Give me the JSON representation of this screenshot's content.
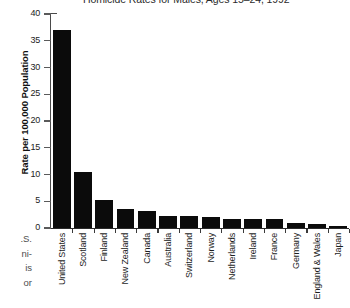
{
  "chart_data": {
    "type": "bar",
    "title": "Homicide Rates for Males, Ages 15–24, 1992",
    "xlabel": "",
    "ylabel": "Rate per 100,000 Population",
    "ylim": [
      0,
      40
    ],
    "ytick_step": 5,
    "grid": false,
    "legend": null,
    "bar_color": "#0b0b0b",
    "categories": [
      "United States",
      "Scotland",
      "Finland",
      "New Zealand",
      "Canada",
      "Australia",
      "Switzerland",
      "Norway",
      "Netherlands",
      "Ireland",
      "France",
      "Germany",
      "England & Wales",
      "Japan"
    ],
    "values": [
      37.0,
      10.5,
      5.2,
      3.6,
      3.2,
      2.2,
      2.2,
      2.0,
      1.7,
      1.7,
      1.6,
      1.0,
      0.8,
      0.4
    ],
    "ytick_labels": [
      "0",
      "5",
      "10",
      "15",
      "20",
      "25",
      "30",
      "35",
      "40"
    ],
    "ytick_values": [
      0,
      5,
      10,
      15,
      20,
      25,
      30,
      35,
      40
    ]
  },
  "caption_fragments": [
    ".S.",
    "ni-",
    "is",
    "or"
  ]
}
